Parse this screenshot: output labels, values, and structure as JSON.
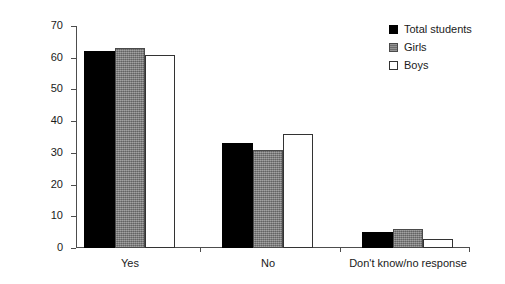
{
  "chart_data": {
    "type": "bar",
    "title": "",
    "subtitle": "",
    "xlabel": "",
    "ylabel": "Percentage of respondents",
    "categories": [
      "Yes",
      "No",
      "Don't know/no response"
    ],
    "series": [
      {
        "name": "Total students",
        "values": [
          62,
          33,
          5
        ],
        "color": "#000000",
        "style": "solid-black"
      },
      {
        "name": "Girls",
        "values": [
          63,
          31,
          6
        ],
        "color": "#808080",
        "style": "textured-gray"
      },
      {
        "name": "Boys",
        "values": [
          61,
          36,
          3
        ],
        "color": "#ffffff",
        "style": "outlined-white"
      }
    ],
    "ylim": [
      0,
      70
    ],
    "yticks": [
      0,
      10,
      20,
      30,
      40,
      50,
      60,
      70
    ],
    "ytick_labels": [
      "0",
      "10",
      "20",
      "30",
      "40",
      "50",
      "60",
      "70"
    ],
    "grid": false,
    "legend_position": "top-right",
    "annotations": []
  },
  "legend": {
    "items": [
      {
        "label": "Total students",
        "swatch": "filled-black-square-icon"
      },
      {
        "label": "Girls",
        "swatch": "filled-gray-square-icon"
      },
      {
        "label": "Boys",
        "swatch": "outlined-white-square-icon"
      }
    ]
  },
  "axes": {
    "y_title": "Percentage of respondents"
  }
}
